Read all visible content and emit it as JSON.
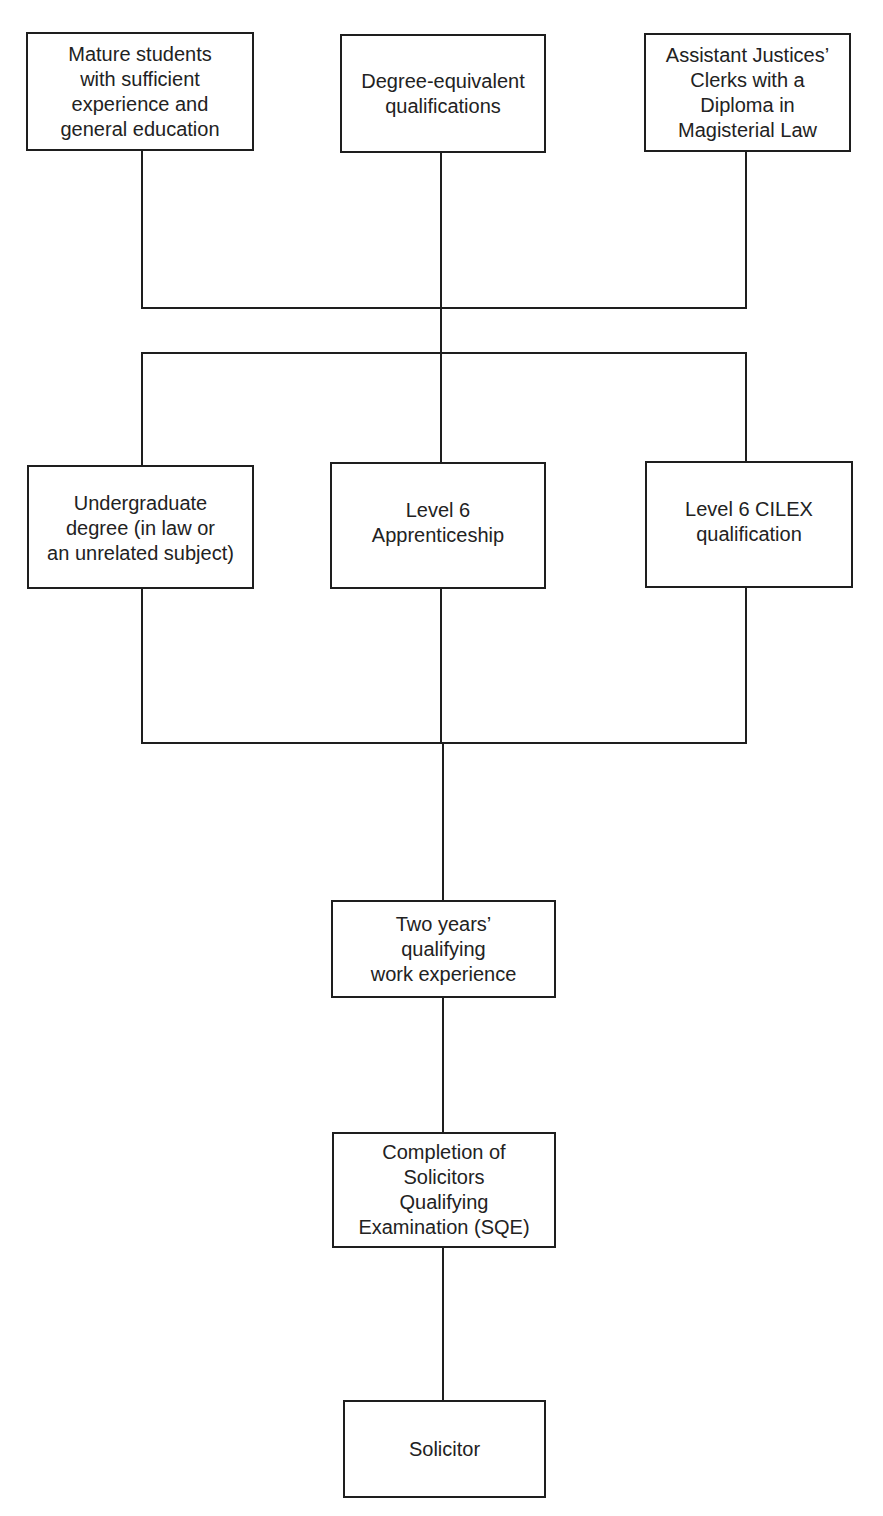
{
  "diagram": {
    "type": "flowchart",
    "title": "",
    "colors": {
      "line": "#1e1e1e",
      "text": "#222222",
      "background": "#ffffff"
    },
    "entry_routes": [
      {
        "id": "mature-students",
        "label": "Mature students\nwith sufficient\nexperience and\ngeneral education"
      },
      {
        "id": "degree-equivalent",
        "label": "Degree-equivalent\nqualifications"
      },
      {
        "id": "assistant-justices-clerks",
        "label": "Assistant Justices’\nClerks with a\nDiploma in\nMagisterial Law"
      }
    ],
    "qualification_routes": [
      {
        "id": "undergraduate-degree",
        "label": "Undergraduate\ndegree (in law or\nan unrelated subject)"
      },
      {
        "id": "level6-apprenticeship",
        "label": "Level 6\nApprenticeship"
      },
      {
        "id": "level6-cilex",
        "label": "Level 6 CILEX\nqualification"
      }
    ],
    "steps": [
      {
        "id": "qualifying-work-experience",
        "label": "Two years’\nqualifying\nwork experience"
      },
      {
        "id": "sqe",
        "label": "Completion of\nSolicitors\nQualifying\nExamination (SQE)"
      },
      {
        "id": "solicitor",
        "label": "Solicitor"
      }
    ],
    "edges": [
      [
        "mature-students",
        "merge-1"
      ],
      [
        "degree-equivalent",
        "merge-1"
      ],
      [
        "assistant-justices-clerks",
        "merge-1"
      ],
      [
        "merge-1",
        "undergraduate-degree"
      ],
      [
        "merge-1",
        "level6-apprenticeship"
      ],
      [
        "merge-1",
        "level6-cilex"
      ],
      [
        "undergraduate-degree",
        "merge-2"
      ],
      [
        "level6-apprenticeship",
        "merge-2"
      ],
      [
        "level6-cilex",
        "merge-2"
      ],
      [
        "merge-2",
        "qualifying-work-experience"
      ],
      [
        "qualifying-work-experience",
        "sqe"
      ],
      [
        "sqe",
        "solicitor"
      ]
    ]
  }
}
